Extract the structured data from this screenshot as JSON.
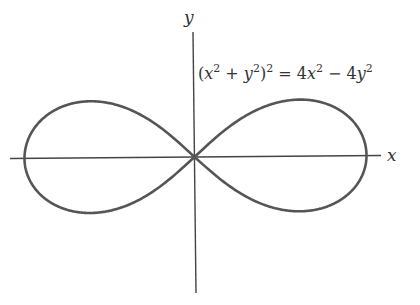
{
  "figure": {
    "equation": {
      "lhs_open": "(",
      "x": "x",
      "sup2": "2",
      "plus": " + ",
      "y": "y",
      "close": ")",
      "equals": " = 4",
      "minus": " − 4"
    },
    "x_axis_label": "x",
    "y_axis_label": "y",
    "curve": {
      "type": "lemniscate",
      "equation_text": "(x^2 + y^2)^2 = 4x^2 - 4y^2",
      "a": 2,
      "color": "#555555"
    },
    "axis_color": "#444444"
  }
}
